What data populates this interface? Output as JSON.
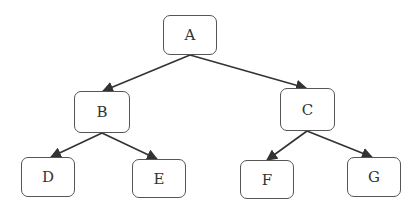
{
  "diagram": {
    "type": "tree",
    "nodes": [
      {
        "id": "A",
        "label": "A",
        "x": 163,
        "y": 15,
        "w": 54,
        "h": 40
      },
      {
        "id": "B",
        "label": "B",
        "x": 74,
        "y": 91,
        "w": 56,
        "h": 42
      },
      {
        "id": "C",
        "label": "C",
        "x": 280,
        "y": 88,
        "w": 55,
        "h": 43
      },
      {
        "id": "D",
        "label": "D",
        "x": 21,
        "y": 157,
        "w": 54,
        "h": 40
      },
      {
        "id": "E",
        "label": "E",
        "x": 132,
        "y": 159,
        "w": 54,
        "h": 39
      },
      {
        "id": "F",
        "label": "F",
        "x": 240,
        "y": 160,
        "w": 54,
        "h": 39
      },
      {
        "id": "G",
        "label": "G",
        "x": 347,
        "y": 157,
        "w": 54,
        "h": 40
      }
    ],
    "edges": [
      {
        "from": "A",
        "to": "B"
      },
      {
        "from": "A",
        "to": "C"
      },
      {
        "from": "B",
        "to": "D"
      },
      {
        "from": "B",
        "to": "E"
      },
      {
        "from": "C",
        "to": "F"
      },
      {
        "from": "C",
        "to": "G"
      }
    ],
    "colors": {
      "edge": "#333333",
      "border": "#555555",
      "text": "#333333"
    }
  }
}
